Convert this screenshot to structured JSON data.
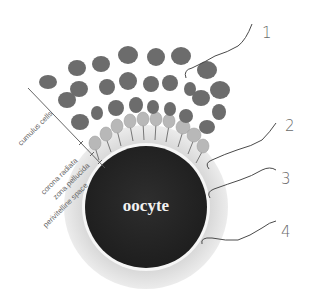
{
  "diagram": {
    "title_in_cell": "oocyte",
    "side_labels": {
      "cumulus": "cumulus cells",
      "corona": "corona radiata",
      "zona": "zona pellucida",
      "perivitelline": "perivitelline space"
    },
    "callouts": [
      {
        "number": "1",
        "target": "cumulus cells"
      },
      {
        "number": "2",
        "target": "corona radiata"
      },
      {
        "number": "3",
        "target": "zona pellucida"
      },
      {
        "number": "4",
        "target": "perivitelline space"
      }
    ],
    "colors": {
      "background": "#ffffff",
      "cumulus_cell": "#6e6e6e",
      "corona_cell": "#b9b9b9",
      "zona": "#dcdcdc",
      "perivitelline": "#f4f4f4",
      "oocyte": "#262626",
      "sperm": "#4a4a4a"
    }
  }
}
